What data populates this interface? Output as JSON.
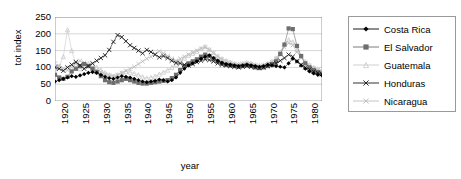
{
  "chart_data": {
    "type": "line",
    "title": "",
    "xlabel": "year",
    "ylabel": "tot index",
    "xlim": [
      1920,
      1984
    ],
    "ylim": [
      0,
      250
    ],
    "ytick_step": 50,
    "yticks": [
      250,
      200,
      150,
      100,
      50,
      0
    ],
    "xticks": [
      1920,
      1925,
      1930,
      1935,
      1940,
      1945,
      1950,
      1955,
      1960,
      1965,
      1970,
      1975,
      1980
    ],
    "grid": "horizontal",
    "legend_position": "right",
    "x": [
      1920,
      1921,
      1922,
      1923,
      1924,
      1925,
      1926,
      1927,
      1928,
      1929,
      1930,
      1931,
      1932,
      1933,
      1934,
      1935,
      1936,
      1937,
      1938,
      1939,
      1940,
      1941,
      1942,
      1943,
      1944,
      1945,
      1946,
      1947,
      1948,
      1949,
      1950,
      1951,
      1952,
      1953,
      1954,
      1955,
      1956,
      1957,
      1958,
      1959,
      1960,
      1961,
      1962,
      1963,
      1964,
      1965,
      1966,
      1967,
      1968,
      1969,
      1970,
      1971,
      1972,
      1973,
      1974,
      1975,
      1976,
      1977,
      1978,
      1979,
      1980,
      1981,
      1982,
      1983,
      1984
    ],
    "series": [
      {
        "name": "Costa Rica",
        "color": "#000000",
        "marker": "diamond",
        "values": [
          58,
          62,
          66,
          70,
          74,
          72,
          76,
          80,
          84,
          86,
          84,
          78,
          72,
          68,
          66,
          70,
          74,
          72,
          70,
          66,
          62,
          58,
          56,
          58,
          60,
          64,
          62,
          58,
          62,
          70,
          84,
          96,
          106,
          112,
          118,
          126,
          132,
          136,
          128,
          120,
          114,
          110,
          108,
          106,
          104,
          106,
          108,
          106,
          104,
          102,
          104,
          108,
          106,
          104,
          102,
          100,
          112,
          126,
          118,
          106,
          96,
          88,
          82,
          78,
          76
        ]
      },
      {
        "name": "El Salvador",
        "color": "#6e6e6e",
        "marker": "square",
        "values": [
          78,
          70,
          66,
          72,
          88,
          96,
          104,
          110,
          104,
          96,
          86,
          74,
          62,
          56,
          54,
          58,
          62,
          66,
          62,
          58,
          54,
          52,
          52,
          54,
          56,
          58,
          60,
          62,
          68,
          78,
          92,
          104,
          112,
          118,
          124,
          132,
          138,
          134,
          126,
          118,
          112,
          108,
          106,
          104,
          102,
          104,
          106,
          104,
          100,
          98,
          100,
          104,
          110,
          118,
          140,
          168,
          216,
          214,
          164,
          134,
          112,
          100,
          92,
          86,
          82
        ]
      },
      {
        "name": "Guatemala",
        "color": "#c9c9c9",
        "marker": "triangle",
        "values": [
          96,
          104,
          132,
          212,
          150,
          110,
          96,
          104,
          112,
          108,
          100,
          92,
          84,
          78,
          74,
          78,
          84,
          88,
          86,
          82,
          78,
          72,
          68,
          70,
          74,
          80,
          86,
          92,
          100,
          108,
          118,
          128,
          136,
          142,
          148,
          156,
          162,
          154,
          144,
          134,
          126,
          120,
          116,
          112,
          110,
          112,
          114,
          112,
          108,
          106,
          108,
          112,
          118,
          128,
          146,
          168,
          182,
          176,
          152,
          132,
          118,
          108,
          100,
          94,
          90
        ]
      },
      {
        "name": "Honduras",
        "color": "#1a1a1a",
        "marker": "x",
        "values": [
          100,
          96,
          90,
          100,
          108,
          116,
          106,
          96,
          104,
          112,
          120,
          128,
          136,
          152,
          176,
          196,
          190,
          178,
          166,
          158,
          150,
          142,
          152,
          146,
          138,
          130,
          134,
          128,
          120,
          114,
          112,
          108,
          106,
          110,
          116,
          120,
          124,
          122,
          118,
          112,
          108,
          106,
          104,
          102,
          100,
          102,
          104,
          102,
          100,
          98,
          100,
          104,
          108,
          112,
          120,
          128,
          138,
          132,
          118,
          108,
          100,
          94,
          88,
          84,
          80
        ]
      },
      {
        "name": "Nicaragua",
        "color": "#bdbdbd",
        "marker": "x",
        "values": [
          112,
          104,
          96,
          92,
          100,
          112,
          120,
          114,
          106,
          98,
          92,
          86,
          80,
          76,
          74,
          78,
          84,
          90,
          96,
          102,
          110,
          118,
          126,
          132,
          140,
          148,
          142,
          134,
          126,
          120,
          126,
          132,
          138,
          144,
          150,
          156,
          160,
          152,
          142,
          132,
          124,
          118,
          114,
          110,
          108,
          110,
          112,
          110,
          106,
          104,
          106,
          110,
          116,
          126,
          142,
          160,
          172,
          166,
          146,
          128,
          114,
          104,
          98,
          92,
          88
        ]
      }
    ]
  },
  "legend": {
    "items": [
      {
        "label": "Costa Rica"
      },
      {
        "label": "El Salvador"
      },
      {
        "label": "Guatemala"
      },
      {
        "label": "Honduras"
      },
      {
        "label": "Nicaragua"
      }
    ]
  }
}
